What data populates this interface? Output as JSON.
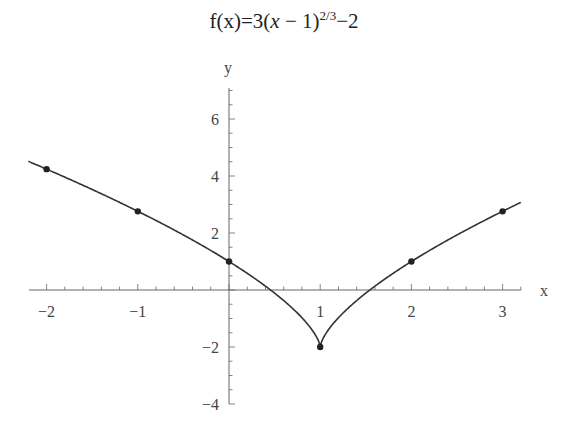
{
  "title": {
    "prefix": "f(x)=3(",
    "var": "x",
    "mid": " − 1)",
    "exponent": "2/3",
    "suffix": "−2"
  },
  "chart_data": {
    "type": "line",
    "xlabel": "x",
    "ylabel": "y",
    "xlim": [
      -2.2,
      3.2
    ],
    "ylim": [
      -4,
      6.8
    ],
    "x_ticks": [
      -2,
      -1,
      1,
      2,
      3
    ],
    "x_tick_labels": [
      "−2",
      "−1",
      "1",
      "2",
      "3"
    ],
    "y_ticks": [
      6,
      4,
      2,
      -2,
      -4
    ],
    "y_tick_labels": [
      "6",
      "4",
      "2",
      "−2",
      "−4"
    ],
    "grid": false,
    "legend": null,
    "series": [
      {
        "name": "f(x) = 3(x-1)^(2/3) - 2",
        "kind": "curve",
        "function": "3*cbrt((x-1)^2)-2",
        "x_range": [
          -2.2,
          3.2
        ]
      },
      {
        "name": "points",
        "kind": "scatter",
        "x": [
          -2,
          -1,
          0,
          1,
          2,
          3
        ],
        "y": [
          4.24,
          2.76,
          1,
          -2,
          1,
          2.76
        ]
      }
    ]
  },
  "layout": {
    "origin_px": [
      229,
      290
    ],
    "x_px_per_unit": 91.2,
    "y_px_per_unit": 28.5,
    "x_axis_px": [
      29,
      521
    ],
    "y_axis_px": [
      88,
      404
    ],
    "line_color": "#333333",
    "axis_color": "#666666",
    "point_color": "#222222"
  }
}
